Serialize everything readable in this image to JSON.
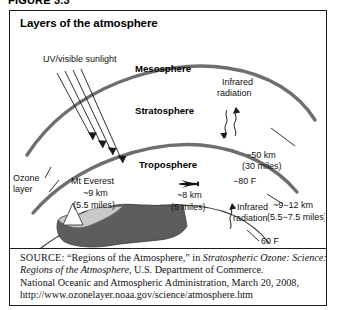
{
  "figure": {
    "number_label": "FIGURE 3.3",
    "title": "Layers of the atmosphere"
  },
  "diagram": {
    "layers": [
      {
        "name": "mesosphere",
        "label": "Mesosphere"
      },
      {
        "name": "stratosphere",
        "label": "Stratosphere"
      },
      {
        "name": "troposphere",
        "label": "Troposphere"
      }
    ],
    "annotations": {
      "sunlight": "UV/visible sunlight",
      "infrared_upper_line1": "Infrared",
      "infrared_upper_line2": "radiation",
      "infrared_lower_line1": "Infrared",
      "infrared_lower_line2": "radiation",
      "ozone_line1": "Ozone",
      "ozone_line2": "layer",
      "everest_name": "Mt Everest",
      "everest_km": "~9 km",
      "everest_miles": "(5.5 miles)",
      "aircraft_km": "~8 km",
      "aircraft_miles": "(5 miles)",
      "mesopause_km": "~50 km",
      "mesopause_miles": "(30 miles)",
      "mesopause_temp": "−80 F",
      "tropopause_km": "~9−12 km",
      "tropopause_miles": "(5.5−7.5 miles)",
      "surface_temp": "60 F"
    },
    "colors": {
      "boundary_curve": "#6e6e6e",
      "surface_curve": "#4a4a4a",
      "land_fill": "#5d5d5d",
      "land_highlight": "#c9c9c9",
      "peak_fill": "#ffffff",
      "text": "#111111",
      "border": "#1a1a1a"
    }
  },
  "source": {
    "label": "SOURCE:",
    "line1_plain_a": " “Regions of the Atmosphere,” in ",
    "line1_italic": "Stratospheric Ozone: Science:",
    "line2_italic": "Regions of the Atmosphere",
    "line2_plain": ", U.S. Department of Commerce.",
    "line3": "National Oceanic and Atmospheric Administration, March 20, 2008,",
    "line4_url": "http://www.ozonelayer.noaa.gov/science/atmosphere.htm"
  }
}
